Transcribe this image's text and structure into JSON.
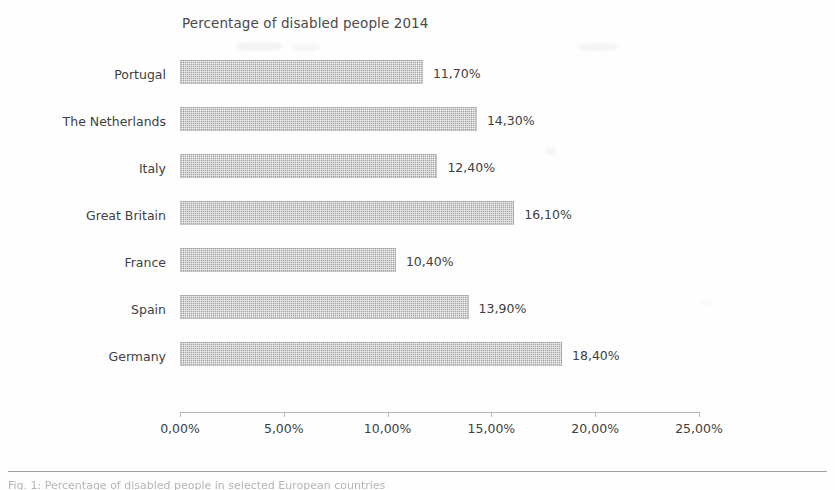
{
  "figure": {
    "title": "Percentage of disabled people 2014",
    "caption": "Fig. 1: Percentage of disabled people in selected European countries"
  },
  "chart_data": {
    "type": "bar",
    "orientation": "horizontal",
    "title": "Percentage of disabled people 2014",
    "xlabel": "",
    "ylabel": "",
    "xlim": [
      0,
      25
    ],
    "grid": false,
    "legend": false,
    "decimal_separator": ",",
    "categories": [
      "Portugal",
      "The Netherlands",
      "Italy",
      "Great Britain",
      "France",
      "Spain",
      "Germany"
    ],
    "values": [
      11.7,
      14.3,
      12.4,
      16.1,
      10.4,
      13.9,
      18.4
    ],
    "value_labels": [
      "11,70%",
      "14,30%",
      "12,40%",
      "16,10%",
      "10,40%",
      "13,90%",
      "18,40%"
    ],
    "xticks": [
      0,
      5,
      10,
      15,
      20,
      25
    ],
    "xtick_labels": [
      "0,00%",
      "5,00%",
      "10,00%",
      "15,00%",
      "20,00%",
      "25,00%"
    ],
    "bar_color": "#a6a6a6",
    "text_color": "#3f3f3f",
    "axis_color": "#b9b9b9"
  }
}
